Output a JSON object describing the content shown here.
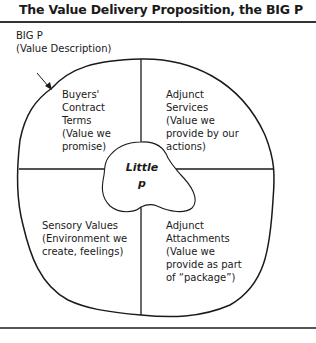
{
  "title": "The Value Delivery Proposition, the BIG P",
  "big_p": {
    "label": "BIG P",
    "sublabel": "(Value Description)"
  },
  "quadrants": [
    {
      "id": "top-left",
      "lines": [
        "Buyers'",
        "Contract",
        "Terms",
        "(Value we",
        "promise)"
      ]
    },
    {
      "id": "top-right",
      "lines": [
        "Adjunct",
        "Services",
        "(Value we",
        "provide by our",
        "actions)"
      ]
    },
    {
      "id": "bottom-left",
      "lines": [
        "Sensory Values",
        "(Environment we",
        "create, feelings)"
      ]
    },
    {
      "id": "bottom-right",
      "lines": [
        "Adjunct",
        "Attachments",
        "(Value we",
        "provide as part",
        "of “package”)"
      ]
    }
  ],
  "little_p": {
    "line1": "Little",
    "line2": "p"
  },
  "colors": {
    "stroke": "#1a1a1a",
    "text": "#1a1a1a",
    "background": "#ffffff"
  }
}
